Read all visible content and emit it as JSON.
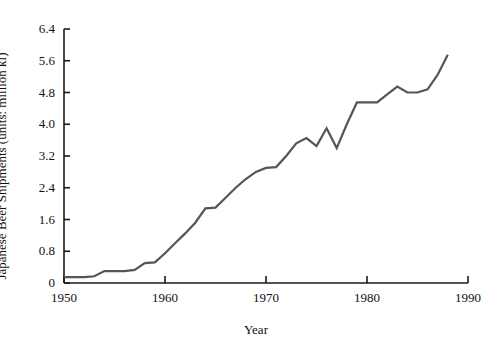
{
  "chart_data": {
    "type": "line",
    "title": "",
    "xlabel": "Year",
    "ylabel": "Japanese Beer Shipments (units: million kl)",
    "xlim": [
      1950,
      1990
    ],
    "ylim": [
      0,
      6.4
    ],
    "grid": false,
    "legend": null,
    "line_color": "#555555",
    "axis_color": "#1a1a1a",
    "x_ticks": [
      1950,
      1960,
      1970,
      1980,
      1990
    ],
    "x_tick_labels": [
      "1950",
      "1960",
      "1970",
      "1980",
      "1990"
    ],
    "y_ticks": [
      0,
      0.8,
      1.6,
      2.4,
      3.2,
      4.0,
      4.8,
      5.6,
      6.4
    ],
    "y_tick_labels": [
      "0",
      "0.8",
      "1.6",
      "2.4",
      "3.2",
      "4.0",
      "4.8",
      "5.6",
      "6.4"
    ],
    "x": [
      1950,
      1951,
      1952,
      1953,
      1954,
      1955,
      1956,
      1957,
      1958,
      1959,
      1960,
      1961,
      1962,
      1963,
      1964,
      1965,
      1966,
      1967,
      1968,
      1969,
      1970,
      1971,
      1972,
      1973,
      1974,
      1975,
      1976,
      1977,
      1978,
      1979,
      1980,
      1981,
      1982,
      1983,
      1984,
      1985,
      1986,
      1987,
      1988
    ],
    "values": [
      0.15,
      0.15,
      0.15,
      0.17,
      0.3,
      0.3,
      0.3,
      0.33,
      0.5,
      0.52,
      0.75,
      1.0,
      1.25,
      1.52,
      1.88,
      1.9,
      2.15,
      2.4,
      2.62,
      2.8,
      2.9,
      2.92,
      3.2,
      3.52,
      3.65,
      3.45,
      3.9,
      3.4,
      4.0,
      4.55,
      4.55,
      4.55,
      4.75,
      4.95,
      4.8,
      4.8,
      4.88,
      5.25,
      5.75
    ],
    "series_name": "Japanese Beer Shipments"
  }
}
